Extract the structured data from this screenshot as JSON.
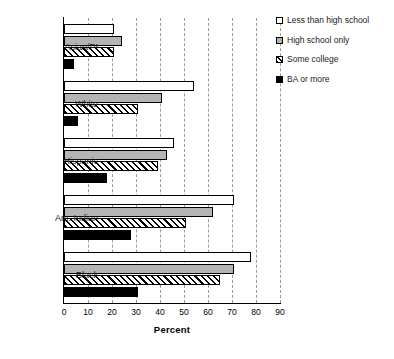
{
  "chart_data": {
    "type": "bar",
    "orientation": "horizontal",
    "title": "",
    "xlabel": "Percent",
    "ylabel": "",
    "xlim": [
      0,
      90
    ],
    "xticks": [
      0,
      10,
      20,
      30,
      40,
      50,
      60,
      70,
      80,
      90
    ],
    "grid": "vertical-dashed",
    "legend_position": "top-right",
    "categories": [
      "Asian/PI",
      "White",
      "Hispanic",
      "Am. Indian",
      "Black"
    ],
    "series": [
      {
        "name": "Less than high school",
        "swatch": "white-outline",
        "values": [
          21,
          54,
          46,
          71,
          78
        ]
      },
      {
        "name": "High school only",
        "swatch": "gray-fill",
        "values": [
          24,
          41,
          43,
          62,
          71
        ]
      },
      {
        "name": "Some college",
        "swatch": "diagonal-hatch",
        "values": [
          21,
          31,
          39,
          51,
          65
        ]
      },
      {
        "name": "BA or more",
        "swatch": "solid-black",
        "values": [
          4,
          6,
          18,
          28,
          31
        ]
      }
    ]
  },
  "colors": {
    "series_0": "#ffffff",
    "series_1": "#b4b4b4",
    "series_2": "#ffffff",
    "series_3": "#000000",
    "outline": "#000000",
    "gridline": "#9a9a9a",
    "background": "#ffffff"
  }
}
